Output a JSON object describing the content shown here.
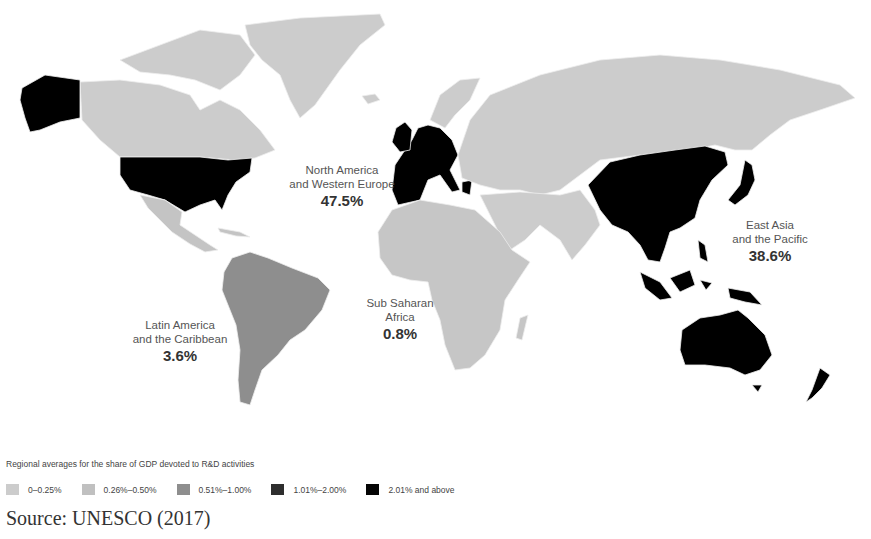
{
  "map": {
    "type": "choropleth",
    "subject": "Regional averages for the share of GDP devoted to R&D activities",
    "regions": [
      {
        "id": "north-america-western-europe",
        "name_line1": "North America",
        "name_line2": "and Western Europe",
        "value": "47.5%"
      },
      {
        "id": "east-asia-pacific",
        "name_line1": "East Asia",
        "name_line2": "and the Pacific",
        "value": "38.6%"
      },
      {
        "id": "latin-america-caribbean",
        "name_line1": "Latin America",
        "name_line2": "and the Caribbean",
        "value": "3.6%"
      },
      {
        "id": "sub-saharan-africa",
        "name_line1": "Sub Saharan",
        "name_line2": "Africa",
        "value": "0.8%"
      }
    ],
    "colors": {
      "c1": "#cccccc",
      "c2": "#c2c2c2",
      "c3": "#8e8e8e",
      "c4": "#2b2b2b",
      "c5": "#000000",
      "border": "#e8e8e8"
    }
  },
  "legend": {
    "title": "Regional averages for the share of GDP devoted to R&D activities",
    "items": [
      {
        "label": "0–0.25%",
        "color": "#cccccc"
      },
      {
        "label": "0.26%–0.50%",
        "color": "#c0c0c0"
      },
      {
        "label": "0.51%–1.00%",
        "color": "#8e8e8e"
      },
      {
        "label": "1.01%–2.00%",
        "color": "#2e2e2e"
      },
      {
        "label": "2.01% and above",
        "color": "#050505"
      }
    ]
  },
  "source": "Source: UNESCO (2017)"
}
